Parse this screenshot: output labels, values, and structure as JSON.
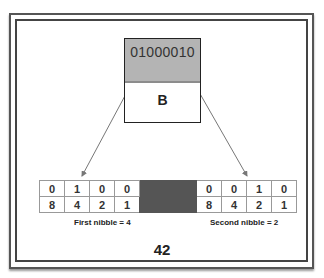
{
  "byte": {
    "bits": "01000010",
    "character": "B"
  },
  "table": {
    "first_nibble": {
      "bits": [
        "0",
        "1",
        "0",
        "0"
      ],
      "weights": [
        "8",
        "4",
        "2",
        "1"
      ]
    },
    "second_nibble": {
      "bits": [
        "0",
        "0",
        "1",
        "0"
      ],
      "weights": [
        "8",
        "4",
        "2",
        "1"
      ]
    }
  },
  "labels": {
    "first_nibble": "First nibble = 4",
    "second_nibble": "Second nibble = 2"
  },
  "result": "42",
  "colors": {
    "byte_top_fill": "#b4b4b4",
    "separator_fill": "#555555",
    "arrow": "#777777"
  }
}
